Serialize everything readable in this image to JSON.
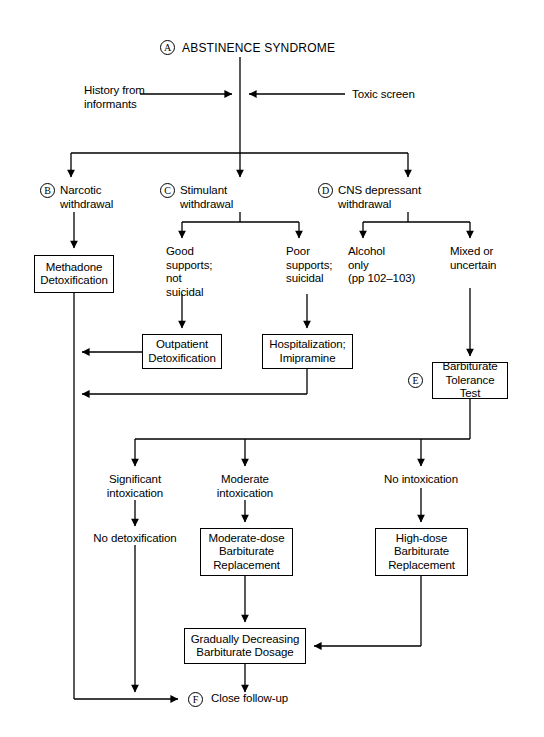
{
  "diagram": {
    "title": "ABSTINENCE SYNDROME",
    "tags": {
      "a": "A",
      "b": "B",
      "c": "C",
      "d": "D",
      "e": "E",
      "f": "F"
    },
    "inputs": {
      "left": "History from\ninformants",
      "right": "Toxic screen"
    },
    "branches": {
      "narcotic": "Narcotic\nwithdrawal",
      "stimulant": "Stimulant\nwithdrawal",
      "cns": "CNS depressant\nwithdrawal"
    },
    "conditions": {
      "good_supports": "Good\nsupports;\nnot\nsuicidal",
      "poor_supports": "Poor\nsupports;\nsuicidal",
      "alcohol_only": "Alcohol\nonly\n(pp 102–103)",
      "mixed_uncertain": "Mixed or\nuncertain",
      "significant_intox": "Significant\nintoxication",
      "moderate_intox": "Moderate\nintoxication",
      "no_intox": "No intoxication",
      "no_detox": "No detoxification"
    },
    "boxes": {
      "methadone": "Methadone\nDetoxification",
      "outpatient": "Outpatient\nDetoxification",
      "hospitalization": "Hospitalization;\nImipramine",
      "tolerance_test": "Barbiturate\nTolerance Test",
      "moderate_dose": "Moderate-dose\nBarbiturate\nReplacement",
      "high_dose": "High-dose\nBarbiturate\nReplacement",
      "gradually_decreasing": "Gradually Decreasing\nBarbiturate Dosage"
    },
    "outcome": {
      "close_follow_up": "Close follow-up"
    },
    "colors": {
      "line": "#000000",
      "background": "#ffffff",
      "text": "#000000"
    }
  }
}
